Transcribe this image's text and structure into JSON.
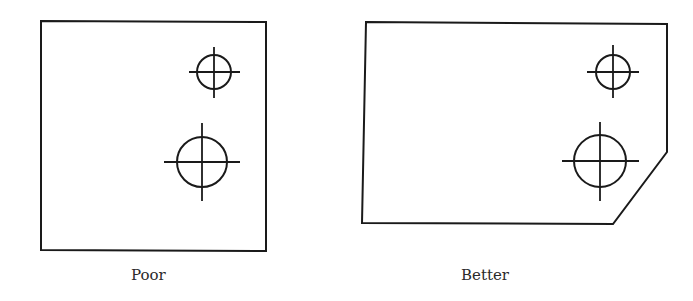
{
  "figure": {
    "panels": [
      {
        "id": "poor",
        "label": "Poor",
        "outline": "square plate, no chamfer",
        "holes": [
          {
            "size": "small",
            "cx": 214,
            "cy": 72,
            "r": 17
          },
          {
            "size": "large",
            "cx": 202,
            "cy": 162,
            "r": 25
          }
        ]
      },
      {
        "id": "better",
        "label": "Better",
        "outline": "rectangular plate with chamfered lower-right corner",
        "holes": [
          {
            "size": "small",
            "cx": 613,
            "cy": 72,
            "r": 17
          },
          {
            "size": "large",
            "cx": 600,
            "cy": 161,
            "r": 26
          }
        ]
      }
    ],
    "colors": {
      "stroke": "#1a1a1a",
      "background": "#ffffff",
      "text": "#2a2a2a"
    }
  }
}
